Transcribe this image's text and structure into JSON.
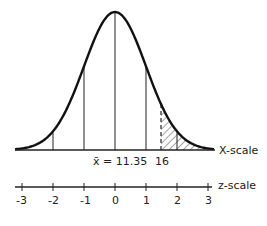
{
  "chart_data": {
    "type": "diagram",
    "title": "",
    "x_scale": {
      "label": "X-scale",
      "mean_label": "x̄ = 11.35",
      "marked_value_label": "16",
      "mean": 11.35,
      "marked_value": 16
    },
    "z_scale": {
      "label": "z-scale",
      "ticks": [
        -3,
        -2,
        -1,
        0,
        1,
        2,
        3
      ],
      "tick_labels": [
        "-3",
        "-2",
        "-1",
        "0",
        "1",
        "2",
        "3"
      ]
    },
    "shaded_region": {
      "from_x": 16,
      "to": "right tail",
      "style": "hatched"
    },
    "vertical_lines_at_z": [
      -3,
      -2,
      -1,
      0,
      1,
      2,
      3
    ],
    "dashed_line_at_x": 16
  },
  "labels": {
    "x_scale": "X-scale",
    "mean": "x̄ = 11.35",
    "marked": "16",
    "z_scale": "z-scale",
    "z_ticks": [
      "-3",
      "-2",
      "-1",
      "0",
      "1",
      "2",
      "3"
    ]
  }
}
